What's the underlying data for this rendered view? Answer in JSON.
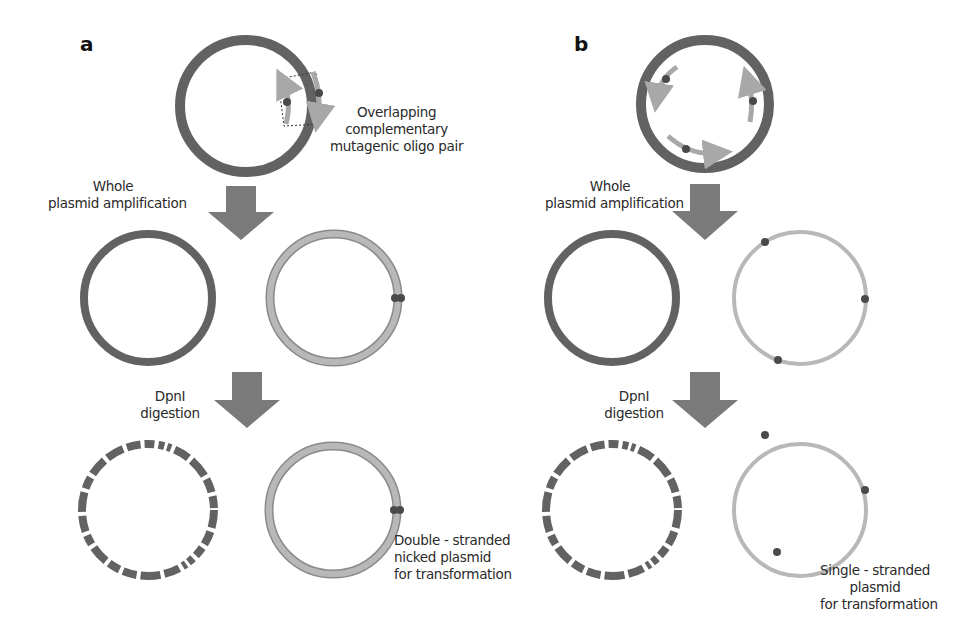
{
  "figure": {
    "panels": [
      {
        "letter": "a",
        "top_annotation": [
          "Overlapping",
          "complementary",
          "mutagenic oligo pair"
        ],
        "step1_label": [
          "Whole",
          "plasmid amplification"
        ],
        "step2_label": [
          "DpnI",
          "digestion"
        ],
        "result_label": [
          "Double - stranded",
          "nicked plasmid",
          "for transformation"
        ]
      },
      {
        "letter": "b",
        "step1_label": [
          "Whole",
          "plasmid amplification"
        ],
        "step2_label": [
          "DpnI",
          "digestion"
        ],
        "result_label": [
          "Single - stranded",
          "plasmid",
          "for transformation"
        ]
      }
    ],
    "colors": {
      "template_strand": "#626262",
      "new_strand": "#b4b4b4",
      "new_strand_outline": "#8a8a8a",
      "mutation_dot": "#4a4a4a",
      "arrow": "#7a7a7a",
      "background": "#ffffff"
    }
  }
}
